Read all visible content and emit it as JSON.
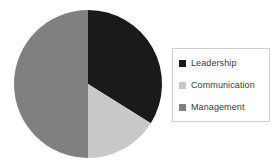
{
  "chart_data": {
    "type": "pie",
    "title": "",
    "categories": [
      "Leadership",
      "Communication",
      "Management"
    ],
    "values": [
      34,
      16,
      50
    ],
    "unit": "percent",
    "colors": [
      "#1a1a1a",
      "#c8c8c8",
      "#808080"
    ],
    "legend_position": "right",
    "grid": false,
    "labels_shown": false,
    "start_angle_deg": 0,
    "direction": "clockwise",
    "slices": [
      {
        "label": "Leadership",
        "value": 34,
        "color": "#1a1a1a",
        "start_deg": 0,
        "end_deg": 122
      },
      {
        "label": "Communication",
        "value": 16,
        "color": "#c8c8c8",
        "start_deg": 122,
        "end_deg": 180
      },
      {
        "label": "Management",
        "value": 50,
        "color": "#808080",
        "start_deg": 180,
        "end_deg": 360
      }
    ]
  },
  "pie": {
    "center_x": 88,
    "center_y": 84,
    "radius": 74
  },
  "legend": {
    "items": [
      {
        "label": "Leadership",
        "swatch_color": "#1a1a1a",
        "icon": "square-swatch-icon"
      },
      {
        "label": "Communication",
        "swatch_color": "#c8c8c8",
        "icon": "square-swatch-icon"
      },
      {
        "label": "Management",
        "swatch_color": "#808080",
        "icon": "square-swatch-icon"
      }
    ],
    "border_color": "#cfcfcf",
    "background_color": "#ffffff"
  },
  "canvas": {
    "background_color": "#ffffff",
    "width": 278,
    "height": 167
  }
}
